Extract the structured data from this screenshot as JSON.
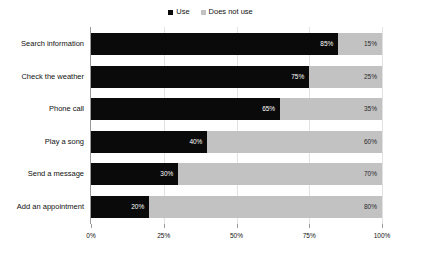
{
  "chart_data": {
    "type": "bar",
    "orientation": "horizontal",
    "stacked": true,
    "title": "",
    "subtitle": "",
    "xlabel": "",
    "ylabel": "",
    "xlim": [
      0,
      100
    ],
    "grid": true,
    "legend_position": "top-center",
    "categories": [
      "Search information",
      "Check the weather",
      "Phone call",
      "Play a song",
      "Send a message",
      "Add an appointment"
    ],
    "series": [
      {
        "name": "Use",
        "color": "#0a0a0a",
        "values": [
          85,
          75,
          65,
          40,
          30,
          20
        ],
        "labels": [
          "85%",
          "75%",
          "65%",
          "40%",
          "30%",
          "20%"
        ]
      },
      {
        "name": "Does not use",
        "color": "#c2c2c2",
        "values": [
          15,
          25,
          35,
          60,
          70,
          80
        ],
        "labels": [
          "15%",
          "25%",
          "35%",
          "60%",
          "70%",
          "80%"
        ]
      }
    ],
    "xticks": [
      0,
      25,
      50,
      75,
      100
    ],
    "xtick_labels": [
      "0%",
      "25%",
      "50%",
      "75%",
      "100%"
    ]
  },
  "legend": {
    "entries": [
      {
        "label": "Use",
        "color": "#0a0a0a",
        "marker": "square-marker"
      },
      {
        "label": "Does not use",
        "color": "#c2c2c2",
        "marker": "square-marker"
      }
    ]
  },
  "colors": {
    "use": "#0a0a0a",
    "does_not_use": "#c2c2c2",
    "axis": "#9a9a9a",
    "gridline": "#e2e2e2",
    "background": "#ffffff",
    "text": "#111111"
  }
}
